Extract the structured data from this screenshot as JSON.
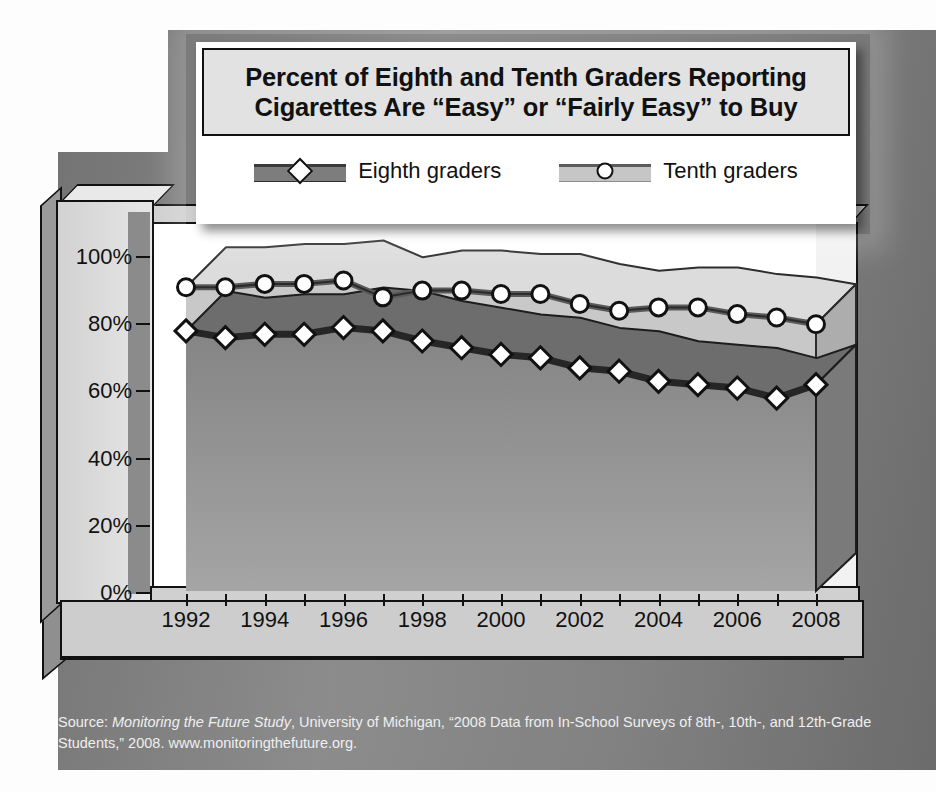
{
  "title": {
    "line1": "Percent of Eighth and Tenth Graders Reporting",
    "line2": "Cigarettes Are “Easy” or “Fairly Easy” to Buy"
  },
  "legend": {
    "items": [
      {
        "label": "Eighth graders",
        "marker": "diamond",
        "swatch_color": "#7d7d7d",
        "line_color": "#3a3a3a"
      },
      {
        "label": "Tenth graders",
        "marker": "circle",
        "swatch_color": "#c6c6c6",
        "line_color": "#5c5c5c"
      }
    ]
  },
  "source": {
    "prefix": "Source: ",
    "italic": "Monitoring the Future Study",
    "rest": ", University of Michigan, “2008 Data from In-School Surveys of 8th-, 10th-, and 12th-Grade Students,” 2008. www.monitoringthefuture.org."
  },
  "chart_data": {
    "type": "area",
    "title": "Percent of Eighth and Tenth Graders Reporting Cigarettes Are “Easy” or “Fairly Easy” to Buy",
    "xlabel": "",
    "ylabel": "",
    "ylim": [
      0,
      100
    ],
    "ytick_labels": [
      "0%",
      "20%",
      "40%",
      "60%",
      "80%",
      "100%"
    ],
    "ytick_values": [
      0,
      20,
      40,
      60,
      80,
      100
    ],
    "grid": false,
    "legend_position": "top",
    "categories": [
      1992,
      1993,
      1994,
      1995,
      1996,
      1997,
      1998,
      1999,
      2000,
      2001,
      2002,
      2003,
      2004,
      2005,
      2006,
      2007,
      2008
    ],
    "xtick_labels": [
      "1992",
      "1994",
      "1996",
      "1998",
      "2000",
      "2002",
      "2004",
      "2006",
      "2008"
    ],
    "xtick_values": [
      1992,
      1994,
      1996,
      1998,
      2000,
      2002,
      2004,
      2006,
      2008
    ],
    "series": [
      {
        "name": "Tenth graders",
        "marker": "circle",
        "color": "#5c5c5c",
        "fill": "#c6c6c6",
        "values": [
          91,
          91,
          92,
          92,
          93,
          88,
          90,
          90,
          89,
          89,
          86,
          84,
          85,
          85,
          83,
          82,
          80
        ]
      },
      {
        "name": "Eighth graders",
        "marker": "diamond",
        "color": "#2e2e2e",
        "fill": "#8a8a8a",
        "values": [
          78,
          76,
          77,
          77,
          79,
          78,
          75,
          73,
          71,
          70,
          67,
          66,
          63,
          62,
          61,
          58,
          62
        ]
      }
    ]
  }
}
